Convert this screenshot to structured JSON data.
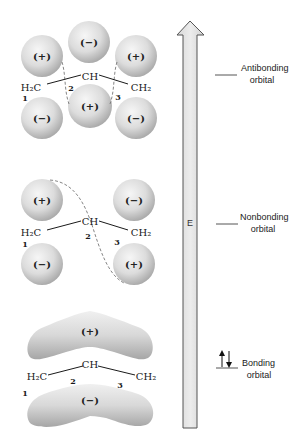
{
  "figure": {
    "energy_axis": {
      "label": "E",
      "direction": "up"
    },
    "colors": {
      "lobe_light": "#f2f2f2",
      "lobe_dark": "#a8a8a8",
      "arrow_fill": "#e2e2e2",
      "arrow_stroke": "#555555",
      "dashed_node": "#777777",
      "text": "#1a1a1a"
    },
    "orbitals": [
      {
        "name": "antibonding",
        "label_line1": "Antibonding",
        "label_line2": "orbital",
        "electrons": 0,
        "structure": {
          "left": "H₂C",
          "center": "CH",
          "right": "CH₂",
          "n1": "1",
          "n2": "2",
          "n3": "3"
        },
        "lobes": {
          "c1_top": "(+)",
          "c1_bottom": "(−)",
          "c2_top": "(−)",
          "c2_bottom": "(+)",
          "c3_top": "(+)",
          "c3_bottom": "(−)"
        }
      },
      {
        "name": "nonbonding",
        "label_line1": "Nonbonding",
        "label_line2": "orbital",
        "electrons": 0,
        "structure": {
          "left": "H₂C",
          "center": "CH",
          "right": "CH₂",
          "n1": "1",
          "n2": "2",
          "n3": "3"
        },
        "lobes": {
          "c1_top": "(+)",
          "c1_bottom": "(−)",
          "c3_top": "(−)",
          "c3_bottom": "(+)"
        }
      },
      {
        "name": "bonding",
        "label_line1": "Bonding",
        "label_line2": "orbital",
        "electrons": 2,
        "structure": {
          "left": "H₂C",
          "center": "CH",
          "right": "CH₂",
          "n1": "1",
          "n2": "2",
          "n3": "3"
        },
        "lobes": {
          "top": "(+)",
          "bottom": "(−)"
        }
      }
    ]
  }
}
